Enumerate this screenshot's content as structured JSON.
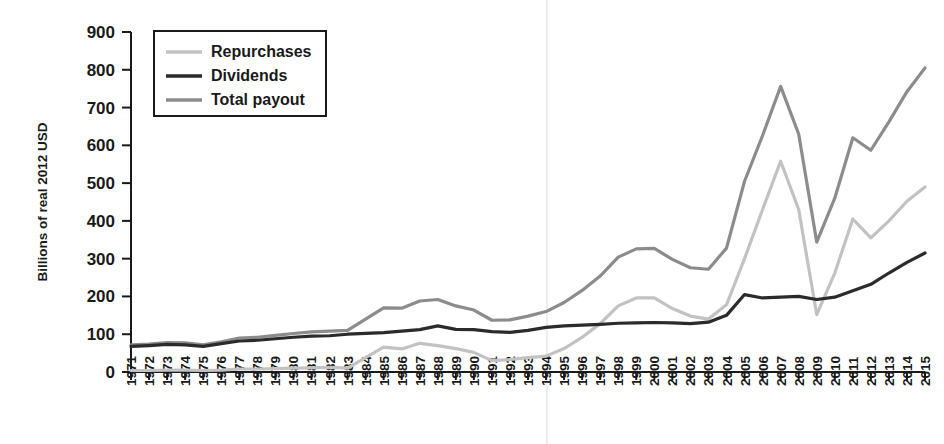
{
  "chart_data": {
    "type": "line",
    "title": "",
    "subtitle": "",
    "xlabel": "",
    "ylabel": "Billions of real 2012 USD",
    "ylim": [
      0,
      900
    ],
    "ytick_step": 100,
    "yticks": [
      "0",
      "100",
      "200",
      "300",
      "400",
      "500",
      "600",
      "700",
      "800",
      "900"
    ],
    "grid": false,
    "legend_position": "top-left",
    "categories": [
      "1971",
      "1972",
      "1973",
      "1974",
      "1975",
      "1976",
      "1977",
      "1978",
      "1979",
      "1980",
      "1981",
      "1982",
      "1983",
      "1984",
      "1985",
      "1986",
      "1987",
      "1988",
      "1989",
      "1990",
      "1991",
      "1992",
      "1993",
      "1994",
      "1995",
      "1996",
      "1997",
      "1998",
      "1999",
      "2000",
      "2001",
      "2002",
      "2003",
      "2004",
      "2005",
      "2006",
      "2007",
      "2008",
      "2009",
      "2010",
      "2011",
      "2012",
      "2013",
      "2014",
      "2015"
    ],
    "series": [
      {
        "name": "Repurchases",
        "color": "#c2c2c2",
        "stroke_width": 3.2,
        "values": [
          4,
          4,
          5,
          5,
          4,
          5,
          8,
          8,
          9,
          10,
          11,
          12,
          10,
          38,
          66,
          61,
          76,
          70,
          62,
          52,
          30,
          33,
          38,
          42,
          62,
          92,
          128,
          175,
          196,
          196,
          168,
          148,
          140,
          178,
          300,
          430,
          558,
          430,
          152,
          262,
          405,
          355,
          400,
          452,
          490
        ]
      },
      {
        "name": "Dividends",
        "color": "#2b2b2b",
        "stroke_width": 3.2,
        "values": [
          68,
          70,
          73,
          72,
          68,
          75,
          82,
          84,
          88,
          92,
          95,
          96,
          100,
          102,
          104,
          108,
          112,
          122,
          113,
          112,
          107,
          105,
          110,
          118,
          122,
          124,
          126,
          129,
          130,
          131,
          130,
          128,
          132,
          150,
          205,
          196,
          198,
          200,
          192,
          198,
          215,
          232,
          262,
          290,
          315
        ]
      },
      {
        "name": "Total payout",
        "color": "#8c8c8c",
        "stroke_width": 3.2,
        "values": [
          72,
          74,
          78,
          77,
          72,
          80,
          90,
          92,
          97,
          102,
          106,
          108,
          110,
          140,
          170,
          169,
          188,
          192,
          175,
          164,
          137,
          138,
          148,
          160,
          184,
          216,
          254,
          304,
          326,
          327,
          298,
          276,
          272,
          328,
          505,
          626,
          756,
          630,
          344,
          460,
          620,
          587,
          662,
          742,
          805
        ]
      }
    ]
  },
  "legend": {
    "entries": [
      {
        "label": "Repurchases"
      },
      {
        "label": "Dividends"
      },
      {
        "label": "Total payout"
      }
    ]
  },
  "axes": {
    "y_title": "Billions of real 2012 USD"
  }
}
